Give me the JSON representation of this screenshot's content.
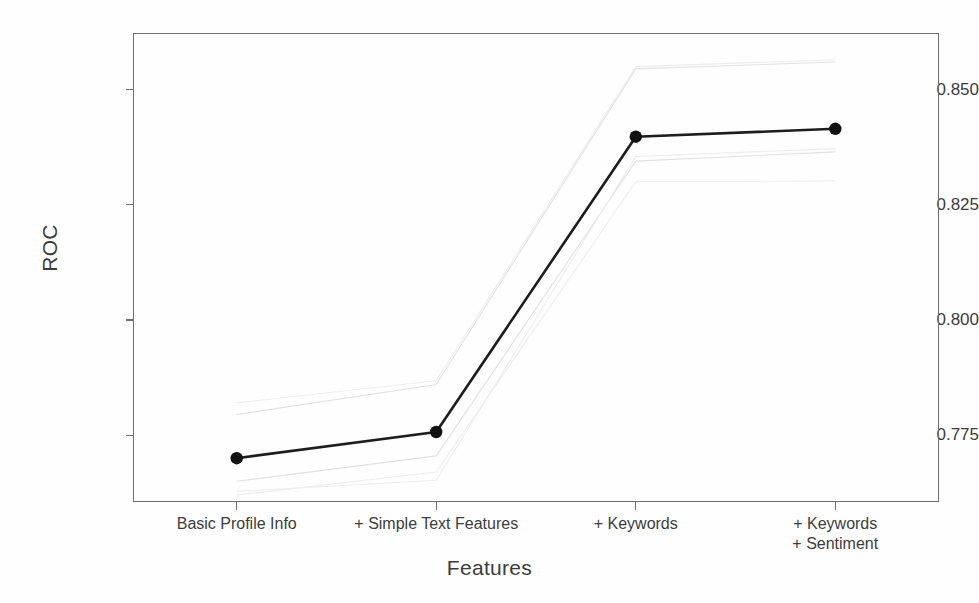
{
  "chart_data": {
    "type": "line",
    "title": "",
    "xlabel": "Features",
    "ylabel": "ROC",
    "categories": [
      "Basic Profile Info",
      "+ Simple Text Features",
      "+ Keywords",
      "+ Keywords\n+ Sentiment"
    ],
    "y_ticks": [
      0.85,
      0.825,
      0.8,
      0.775
    ],
    "y_tick_labels": [
      "0.850",
      "0.825",
      "0.800",
      "0.775"
    ],
    "ylim": [
      0.7605,
      0.8623
    ],
    "xlim": [
      -0.52,
      3.52
    ],
    "grid": false,
    "legend": null,
    "series": [
      {
        "name": "Mean ROC",
        "style": "solid-black-with-markers",
        "color": "#1d1d1d",
        "values": [
          0.77,
          0.7757,
          0.8398,
          0.8415
        ]
      },
      {
        "name": "Fold 1",
        "style": "faint-grey",
        "color": "#e2e2e2",
        "values": [
          0.765,
          0.7705,
          0.8345,
          0.8365
        ]
      },
      {
        "name": "Fold 2",
        "style": "faint-grey",
        "color": "#e2e2e2",
        "values": [
          0.7795,
          0.786,
          0.8545,
          0.856
        ]
      },
      {
        "name": "Fold 3",
        "style": "faint-grey",
        "color": "#ededed",
        "values": [
          0.762,
          0.767,
          0.83,
          0.8302
        ]
      },
      {
        "name": "Fold 4",
        "style": "faint-grey",
        "color": "#ededed",
        "values": [
          0.7628,
          0.7652,
          0.8355,
          0.8372
        ]
      },
      {
        "name": "Fold 5",
        "style": "faint-grey",
        "color": "#ededed",
        "values": [
          0.782,
          0.7868,
          0.855,
          0.8565
        ]
      }
    ]
  },
  "axes": {
    "y_title": "ROC",
    "x_title": "Features"
  }
}
